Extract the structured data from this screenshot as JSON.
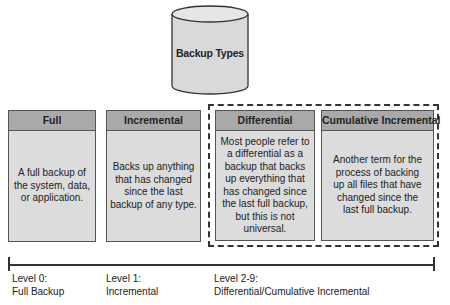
{
  "title": {
    "label": "Backup Types",
    "shape": "cylinder-icon"
  },
  "boxes": [
    {
      "heading": "Full",
      "text": "A full backup of the system, data, or application."
    },
    {
      "heading": "Incremental",
      "text": "Backs up anything that has changed since the last backup of any type."
    },
    {
      "heading": "Differential",
      "text": "Most people refer to a differential as a backup that backs up everything that has changed since the last full backup, but this is not universal."
    },
    {
      "heading": "Cumulative Incremental",
      "text": "Another term for the process of backing up all files that have changed since the last full backup."
    }
  ],
  "timeline": {
    "levels": [
      {
        "level": "Level 0:",
        "name": "Full Backup"
      },
      {
        "level": "Level 1:",
        "name": "Incremental"
      },
      {
        "level": "Level 2-9:",
        "name": "Differential/Cumulative Incremental"
      }
    ]
  },
  "colors": {
    "header_fill": "#a9a9a9",
    "body_fill": "#dcdcdc",
    "cylinder_fill": "#d9d9d9",
    "stroke": "#333333"
  }
}
